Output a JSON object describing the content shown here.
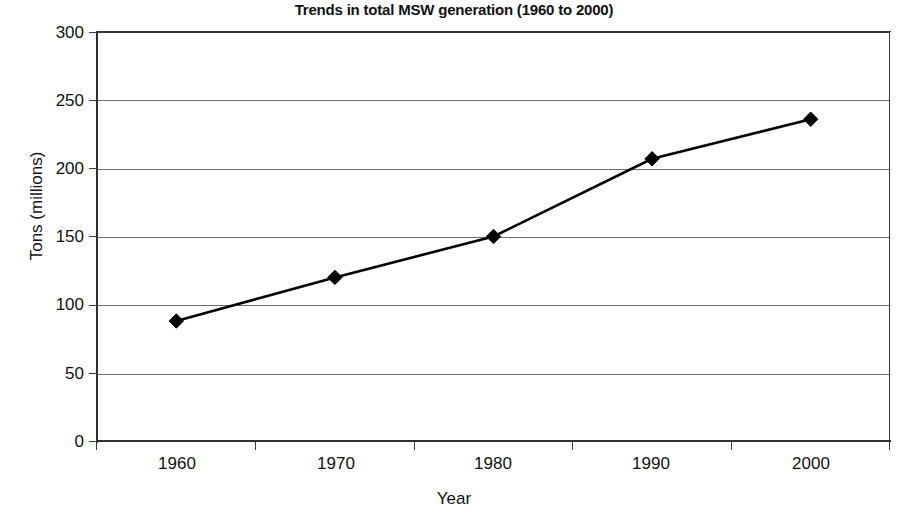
{
  "chart_data": {
    "type": "line",
    "title": "Trends in total MSW generation (1960 to 2000)",
    "xlabel": "Year",
    "ylabel": "Tons (millions)",
    "categories": [
      "1960",
      "1970",
      "1980",
      "1990",
      "2000"
    ],
    "values": [
      88,
      120,
      150,
      207,
      236
    ],
    "series": [
      {
        "name": "Total MSW generation",
        "values": [
          88,
          120,
          150,
          207,
          236
        ]
      }
    ],
    "ylim": [
      0,
      300
    ],
    "y_ticks": [
      "0",
      "50",
      "100",
      "150",
      "200",
      "250",
      "300"
    ],
    "y_tick_values": [
      0,
      50,
      100,
      150,
      200,
      250,
      300
    ],
    "x_ticks": [
      "1960",
      "1970",
      "1980",
      "1990",
      "2000"
    ],
    "grid": "horizontal",
    "legend": "none",
    "marker": "diamond",
    "line_color": "#000000",
    "marker_color": "#000000",
    "grid_color": "#6f6f6f",
    "background_color": "#ffffff"
  },
  "axis": {
    "y_title": "Tons (millions)",
    "x_title": "Year"
  }
}
